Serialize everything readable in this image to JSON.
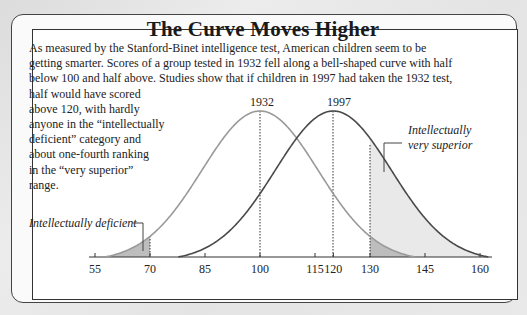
{
  "title": "The Curve Moves Higher",
  "intro_lines": [
    "As measured by the Stanford-Binet intelligence test, American children seem to be",
    "getting smarter. Scores of a group tested in 1932 fell along a bell-shaped curve with half",
    "below 100 and half above. Studies show that if children in 1997 had taken the 1932 test,"
  ],
  "intro_continued_lines": [
    "half would have scored",
    "above 120, with hardly",
    "anyone in the “intellectually",
    "deficient” category and",
    "about one-fourth ranking",
    "in the “very superior”",
    "range."
  ],
  "colors": {
    "curve_1932": "#9a9a9a",
    "curve_1997": "#4a4a4a",
    "shade_light": "#e9e9e9",
    "shade_dark": "#bdbdbd"
  },
  "chart_data": {
    "type": "area",
    "title": "The Curve Moves Higher",
    "xlabel": "",
    "ylabel": "",
    "x_ticks": [
      55,
      70,
      85,
      100,
      115,
      120,
      130,
      145,
      160
    ],
    "x_range": [
      52,
      163
    ],
    "grid": false,
    "series": [
      {
        "name": "1932",
        "mean": 100,
        "description": "bell curve centered at 100"
      },
      {
        "name": "1997",
        "mean": 120,
        "description": "bell curve centered at 120"
      }
    ],
    "reference_lines": [
      {
        "x": 70,
        "label": "Intellectually deficient threshold"
      },
      {
        "x": 100,
        "label": "1932 mean"
      },
      {
        "x": 120,
        "label": "1997 mean"
      },
      {
        "x": 130,
        "label": "Intellectually very superior threshold"
      }
    ],
    "annotations": [
      {
        "text": "1932",
        "x": 100
      },
      {
        "text": "1997",
        "x": 120
      },
      {
        "text": "Intellectually deficient",
        "region": "score < 70"
      },
      {
        "text": "Intellectually very superior",
        "region": "score > 130"
      }
    ]
  },
  "labels": {
    "peak_1932": "1932",
    "peak_1997": "1997",
    "deficient": "Intellectually deficient",
    "superior_line1": "Intellectually",
    "superior_line2": "very superior"
  },
  "ticks": [
    "55",
    "70",
    "85",
    "100",
    "115",
    "120",
    "130",
    "145",
    "160"
  ]
}
